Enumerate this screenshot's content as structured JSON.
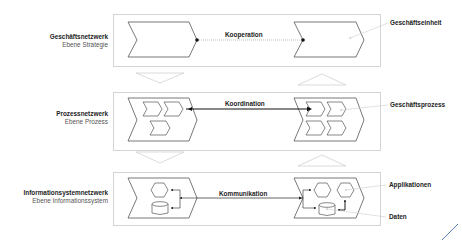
{
  "layers": [
    {
      "title": "Geschäftsnetzwerk",
      "subtitle": "Ebene Strategie",
      "connector": "Kooperation",
      "annotations": [
        "Geschäftseinheit"
      ]
    },
    {
      "title": "Prozessnetzwerk",
      "subtitle": "Ebene Prozess",
      "connector": "Koordination",
      "annotations": [
        "Geschäftsprozess"
      ]
    },
    {
      "title": "Informationsystemnetzwerk",
      "subtitle": "Ebene Informationssystem",
      "connector": "Kommunikation",
      "annotations": [
        "Applikationen",
        "Daten"
      ]
    }
  ],
  "colors": {
    "frame_border": "#d4d4d4",
    "shape_stroke": "#555555",
    "arrow_outline": "#cccccc",
    "connector_strong": "#111111",
    "connector_weak": "#888888",
    "accent_line": "#4a6fb0"
  }
}
